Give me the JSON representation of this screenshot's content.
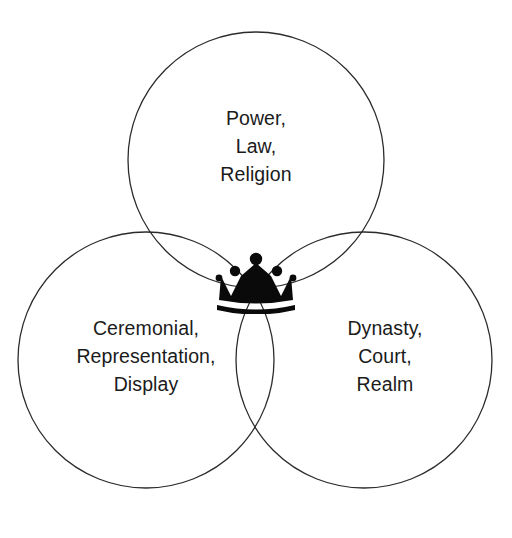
{
  "diagram": {
    "type": "venn-3-circle",
    "title": "",
    "background_color": "#ffffff",
    "stroke_color": "#2b2b2b",
    "text_color": "#1b1b1b",
    "icon_color": "#0a0a0a",
    "center_icon": "crown-icon",
    "sets": [
      {
        "id": "top",
        "position": "top",
        "lines": [
          "Power,",
          "Law,",
          "Religion"
        ],
        "line1": "Power,",
        "line2": "Law,",
        "line3": "Religion",
        "cx": 256,
        "cy": 160,
        "r": 128
      },
      {
        "id": "left",
        "position": "bottom-left",
        "lines": [
          "Ceremonial,",
          "Representation,",
          "Display"
        ],
        "line1": "Ceremonial,",
        "line2": "Representation,",
        "line3": "Display",
        "cx": 146,
        "cy": 360,
        "r": 128
      },
      {
        "id": "right",
        "position": "bottom-right",
        "lines": [
          "Dynasty,",
          "Court,",
          "Realm"
        ],
        "line1": "Dynasty,",
        "line2": "Court,",
        "line3": "Realm",
        "cx": 364,
        "cy": 360,
        "r": 128
      }
    ]
  }
}
